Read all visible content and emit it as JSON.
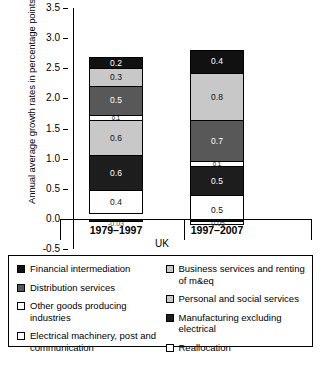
{
  "chart_data": {
    "type": "bar",
    "subtype": "stacked-bar",
    "title": "",
    "xlabel": "UK",
    "ylabel": "Annual average growth rates in percentage points",
    "categories": [
      "1979–1997",
      "1997–2007"
    ],
    "ylim": [
      -0.5,
      3.5
    ],
    "yticks": [
      "-0.5",
      "0.0",
      "0.5",
      "1.0",
      "1.5",
      "2.0",
      "2.5",
      "3.0",
      "3.5"
    ],
    "ytick_values": [
      -0.5,
      0.0,
      0.5,
      1.0,
      1.5,
      2.0,
      2.5,
      3.0,
      3.5
    ],
    "grid": false,
    "legend_position": "below",
    "series": [
      {
        "name": "Reallocation",
        "color": "#ffffff",
        "swatch": "sw-white",
        "values": [
          -0.03,
          -0.05
        ]
      },
      {
        "name": "Other goods producing industries",
        "color": "#ffffff",
        "swatch": "sw-white",
        "values": [
          0.4,
          0.5
        ]
      },
      {
        "name": "Manufacturing excluding electrical",
        "color": "#1d1d1d",
        "swatch": "sw-darkest",
        "values": [
          0.6,
          0.5
        ]
      },
      {
        "name": "Business services and renting of m&eq",
        "color": "#c8c8c8",
        "swatch": "sw-light",
        "values": [
          0.6,
          0.1
        ]
      },
      {
        "name": "Distribution services",
        "color": "#585858",
        "swatch": "sw-dark",
        "values": [
          0.5,
          0.7
        ]
      },
      {
        "name": "Personal and social services",
        "color": "#c8c8c8",
        "swatch": "sw-light",
        "values": [
          0.3,
          0.8
        ]
      },
      {
        "name": "Financial intermediation",
        "color": "#111111",
        "swatch": "sw-black",
        "values": [
          0.2,
          0.4
        ]
      }
    ],
    "bars": [
      {
        "category": "1979–1997",
        "total": 2.68,
        "negative_label": "-0.03",
        "segments": [
          {
            "label": "0.2",
            "value": 0.2,
            "style": "c-black",
            "series": "Financial intermediation"
          },
          {
            "label": "0.3",
            "value": 0.3,
            "style": "c-light",
            "series": "Personal and social services"
          },
          {
            "label": "0.5",
            "value": 0.5,
            "style": "c-dark",
            "series": "Distribution services"
          },
          {
            "label": "0.1",
            "value": 0.1,
            "style": "c-white",
            "series": "Electrical machinery, post and communication"
          },
          {
            "label": "0.6",
            "value": 0.6,
            "style": "c-light",
            "series": "Business services and renting of m&eq"
          },
          {
            "label": "0.6",
            "value": 0.6,
            "style": "c-darkest",
            "series": "Manufacturing excluding electrical"
          },
          {
            "label": "0.4",
            "value": 0.4,
            "style": "c-white",
            "series": "Other goods producing industries"
          }
        ]
      },
      {
        "category": "1997–2007",
        "total": 2.81,
        "negative_label": "-0.05",
        "segments": [
          {
            "label": "0.4",
            "value": 0.4,
            "style": "c-black",
            "series": "Financial intermediation"
          },
          {
            "label": "0.8",
            "value": 0.8,
            "style": "c-light",
            "series": "Personal and social services"
          },
          {
            "label": "0.7",
            "value": 0.7,
            "style": "c-dark",
            "series": "Distribution services"
          },
          {
            "label": "0.1",
            "value": 0.1,
            "style": "c-white",
            "series": "Electrical machinery, post and communication"
          },
          {
            "label": "0.5",
            "value": 0.5,
            "style": "c-darkest",
            "series": "Manufacturing excluding electrical"
          },
          {
            "label": "0.5",
            "value": 0.5,
            "style": "c-white",
            "series": "Other goods producing industries"
          }
        ]
      }
    ],
    "legend_left": [
      {
        "label": "Financial intermediation",
        "swatch": "sw-black"
      },
      {
        "label": "Distribution services",
        "swatch": "sw-dark"
      },
      {
        "label": "Other goods producing industries",
        "swatch": "sw-white"
      },
      {
        "label": "Electrical machinery, post and communication",
        "swatch": "sw-white"
      }
    ],
    "legend_right": [
      {
        "label": "Business services and renting of m&eq",
        "swatch": "sw-light"
      },
      {
        "label": "Personal and social services",
        "swatch": "sw-light"
      },
      {
        "label": "Manufacturing excluding electrical",
        "swatch": "sw-darkest"
      },
      {
        "label": "Reallocation",
        "swatch": "sw-white"
      }
    ]
  }
}
